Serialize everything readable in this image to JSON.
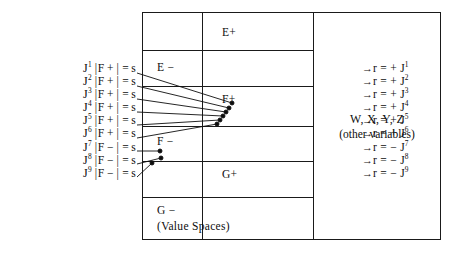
{
  "diagram": {
    "left_equations": [
      {
        "index": "1",
        "space": "F",
        "sign": "+",
        "text_prefix": "J",
        "bracket_open": "|",
        "bracket_close": "|",
        "equals": "=",
        "value": "s"
      },
      {
        "index": "2",
        "space": "F",
        "sign": "+",
        "text_prefix": "J",
        "bracket_open": "|",
        "bracket_close": "|",
        "equals": "=",
        "value": "s"
      },
      {
        "index": "3",
        "space": "F",
        "sign": "+",
        "text_prefix": "J",
        "bracket_open": "|",
        "bracket_close": "|",
        "equals": "=",
        "value": "s"
      },
      {
        "index": "4",
        "space": "F",
        "sign": "+",
        "text_prefix": "J",
        "bracket_open": "|",
        "bracket_close": "|",
        "equals": "=",
        "value": "s"
      },
      {
        "index": "5",
        "space": "F",
        "sign": "+",
        "text_prefix": "J",
        "bracket_open": "|",
        "bracket_close": "|",
        "equals": "=",
        "value": "s"
      },
      {
        "index": "6",
        "space": "F",
        "sign": "+",
        "text_prefix": "J",
        "bracket_open": "|",
        "bracket_close": "|",
        "equals": "=",
        "value": "s"
      },
      {
        "index": "7",
        "space": "F",
        "sign": "−",
        "text_prefix": "J",
        "bracket_open": "|",
        "bracket_close": "|",
        "equals": "=",
        "value": "s"
      },
      {
        "index": "8",
        "space": "F",
        "sign": "−",
        "text_prefix": "J",
        "bracket_open": "|",
        "bracket_close": "|",
        "equals": "=",
        "value": "s"
      },
      {
        "index": "9",
        "space": "F",
        "sign": "−",
        "text_prefix": "J",
        "bracket_open": "|",
        "bracket_close": "|",
        "equals": "=",
        "value": "s"
      }
    ],
    "right_results": [
      {
        "arrow": "→",
        "var": "r",
        "equals": "=",
        "sign": "+",
        "target": "J",
        "index": "1"
      },
      {
        "arrow": "→",
        "var": "r",
        "equals": "=",
        "sign": "+",
        "target": "J",
        "index": "2"
      },
      {
        "arrow": "→",
        "var": "r",
        "equals": "=",
        "sign": "+",
        "target": "J",
        "index": "3"
      },
      {
        "arrow": "→",
        "var": "r",
        "equals": "=",
        "sign": "+",
        "target": "J",
        "index": "4"
      },
      {
        "arrow": "→",
        "var": "r",
        "equals": "=",
        "sign": "+",
        "target": "J",
        "index": "5"
      },
      {
        "arrow": "→",
        "var": "r",
        "equals": "=",
        "sign": "+",
        "target": "J",
        "index": "6"
      },
      {
        "arrow": "→",
        "var": "r",
        "equals": "=",
        "sign": "−",
        "target": "J",
        "index": "7"
      },
      {
        "arrow": "→",
        "var": "r",
        "equals": "=",
        "sign": "−",
        "target": "J",
        "index": "8"
      },
      {
        "arrow": "→",
        "var": "r",
        "equals": "=",
        "sign": "−",
        "target": "J",
        "index": "9"
      }
    ],
    "value_spaces": {
      "caption": "(Value Spaces)",
      "cells": [
        {
          "id": "e-plus",
          "label": "E+",
          "column": "right"
        },
        {
          "id": "e-minus",
          "label": "E −",
          "column": "left"
        },
        {
          "id": "f-plus",
          "label": "F+",
          "column": "right"
        },
        {
          "id": "f-minus",
          "label": "F −",
          "column": "left"
        },
        {
          "id": "g-plus",
          "label": "G+",
          "column": "right"
        },
        {
          "id": "g-minus",
          "label": "G −",
          "column": "left"
        }
      ]
    },
    "variables_panel": {
      "line1": "W, X, Y, Z",
      "line2": "(other variables)"
    }
  },
  "colors": {
    "ink": "#0d0d0d",
    "rule": "#1a1a1a",
    "background": "#ffffff"
  }
}
